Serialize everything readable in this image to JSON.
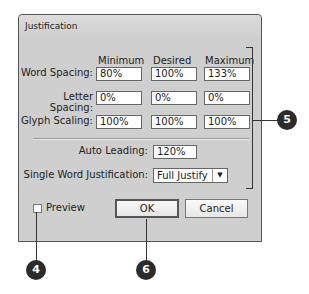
{
  "dialog": {
    "title": "Justification",
    "columns": [
      "Minimum",
      "Desired",
      "Maximum"
    ],
    "rows": [
      {
        "label": "Word Spacing:",
        "values": [
          "80%",
          "100%",
          "133%"
        ]
      },
      {
        "label": "Letter Spacing:",
        "values": [
          "0%",
          "0%",
          "0%"
        ]
      },
      {
        "label": "Glyph Scaling:",
        "values": [
          "100%",
          "100%",
          "100%"
        ]
      }
    ],
    "auto_leading": {
      "label": "Auto Leading:",
      "value": "120%"
    },
    "single_word": {
      "label": "Single Word Justification:",
      "value": "Full Justify"
    },
    "preview": {
      "label": "Preview",
      "checked": false
    },
    "ok_label": "OK",
    "cancel_label": "Cancel"
  },
  "callouts": {
    "preview": "4",
    "fields": "5",
    "ok": "6"
  }
}
